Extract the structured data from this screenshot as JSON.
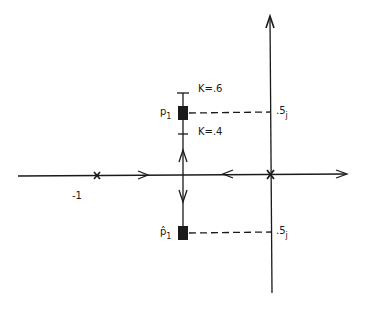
{
  "diagram": {
    "type": "root-locus",
    "axes": {
      "real_axis": {
        "label": "Re"
      },
      "imag_axis": {
        "label": "Im"
      }
    },
    "poles": [
      {
        "label": "-1",
        "value": -1
      },
      {
        "label": "0",
        "value": 0
      }
    ],
    "closed_loop_poles": {
      "upper": {
        "symbol": "p",
        "subscript": "1"
      },
      "lower": {
        "symbol": "p̂",
        "subscript": "1"
      }
    },
    "gain_markers": [
      {
        "label": "K=.6"
      },
      {
        "label": "K=.4"
      }
    ],
    "imag_markers": [
      {
        "value": ".5",
        "unit": "j"
      },
      {
        "value": ".5",
        "unit": "j"
      }
    ],
    "colors": {
      "line": "#1a1a1a",
      "background": "#ffffff"
    }
  }
}
